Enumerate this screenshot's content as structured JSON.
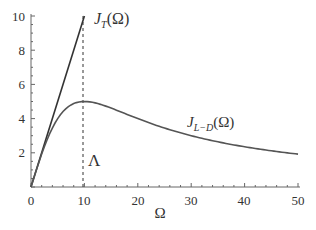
{
  "chart_data": {
    "type": "line",
    "title": "",
    "xlabel": "Ω",
    "ylabel": "",
    "xlim": [
      0,
      50
    ],
    "ylim": [
      0,
      10
    ],
    "x_ticks": [
      0,
      10,
      20,
      30,
      40,
      50
    ],
    "y_ticks": [
      2,
      4,
      6,
      8,
      10
    ],
    "grid": false,
    "series": [
      {
        "name": "J_T(Ω)",
        "label": "J_T(Ω)",
        "description": "linear, J = Ω, for 0 ≤ Ω ≤ 10",
        "x": [
          0,
          10
        ],
        "y": [
          0,
          10
        ],
        "color": "#333333"
      },
      {
        "name": "J_{L-D}(Ω)",
        "label": "J_{L−D}(Ω)",
        "description": "Lorentz–Drude, J = Ω / (1 + (Ω/Λ)^2), Λ = 10",
        "x": [
          0,
          2,
          4,
          6,
          8,
          10,
          15,
          20,
          25,
          30,
          35,
          40,
          45,
          50
        ],
        "y": [
          0,
          1.92,
          3.45,
          4.41,
          4.88,
          5.0,
          4.62,
          4.0,
          3.45,
          3.0,
          2.64,
          2.35,
          2.12,
          1.92
        ],
        "color": "#555555"
      }
    ],
    "annotations": [
      {
        "text": "Λ",
        "type": "vertical-dashed-line",
        "x": 10
      },
      {
        "text": "J_T(Ω)",
        "near": "top of linear line"
      },
      {
        "text": "J_{L−D}(Ω)",
        "near": "Ω≈38, J≈4"
      }
    ]
  },
  "labels": {
    "x_axis": "Ω",
    "lambda": "Λ",
    "jt_main": "J",
    "jt_sub": "T",
    "jt_arg": "(Ω)",
    "jld_main": "J",
    "jld_sub": "L−D",
    "jld_arg": "(Ω)"
  },
  "ticks": {
    "x": [
      "0",
      "10",
      "20",
      "30",
      "40",
      "50"
    ],
    "y": [
      "2",
      "4",
      "6",
      "8",
      "10"
    ]
  }
}
